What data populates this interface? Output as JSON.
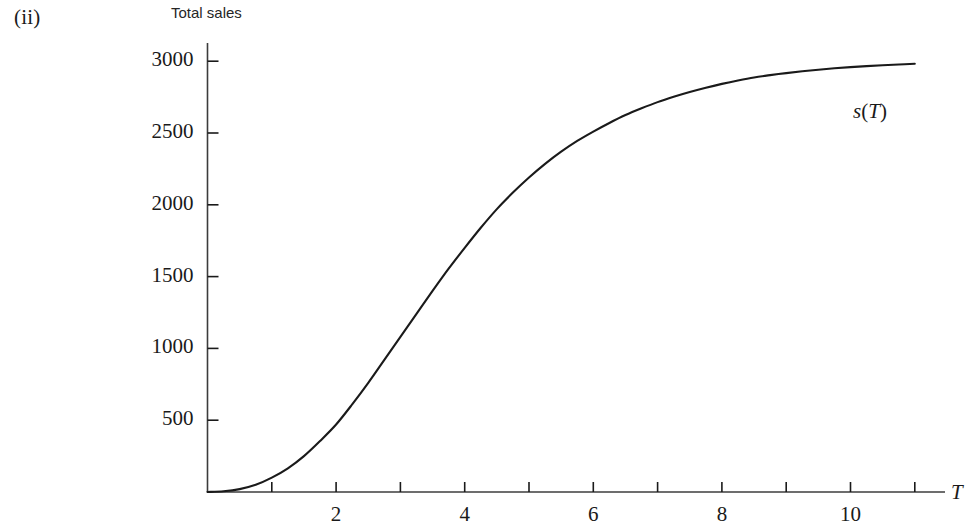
{
  "figure": {
    "part_label": "(ii)",
    "y_axis_title": "Total sales",
    "x_axis_title": "T",
    "curve_label_fn": "s",
    "curve_label_open": "(",
    "curve_label_arg": "T",
    "curve_label_close": ")",
    "line_color": "#1a1a1a",
    "axis_color": "#3c3c3c",
    "background": "#ffffff"
  },
  "chart_data": {
    "type": "line",
    "title": "",
    "subtitle": "",
    "xlabel": "T",
    "ylabel": "Total sales",
    "xlim": [
      0,
      11.5
    ],
    "ylim": [
      0,
      3100
    ],
    "grid": false,
    "legend": null,
    "x_ticks_major": [
      2,
      4,
      6,
      8,
      10
    ],
    "x_ticks_all": [
      1,
      2,
      3,
      4,
      5,
      6,
      7,
      8,
      9,
      10,
      11
    ],
    "x_tick_labels": [
      "2",
      "4",
      "6",
      "8",
      "10"
    ],
    "y_ticks": [
      500,
      1000,
      1500,
      2000,
      2500,
      3000
    ],
    "y_tick_labels": [
      "500",
      "1000",
      "1500",
      "2000",
      "2500",
      "3000"
    ],
    "annotations": [
      {
        "text": "s(T)",
        "x": 10.1,
        "y": 2600
      }
    ],
    "series": [
      {
        "name": "s(T)",
        "color": "#1a1a1a",
        "x": [
          0,
          0.25,
          0.5,
          0.75,
          1,
          1.25,
          1.5,
          1.75,
          2,
          2.25,
          2.5,
          2.75,
          3,
          3.25,
          3.5,
          3.75,
          4,
          4.25,
          4.5,
          4.75,
          5,
          5.25,
          5.5,
          5.75,
          6,
          6.25,
          6.5,
          6.75,
          7,
          7.25,
          7.5,
          7.75,
          8,
          8.25,
          8.5,
          8.75,
          9,
          9.25,
          9.5,
          9.75,
          10,
          10.25,
          10.5,
          10.75,
          11
        ],
        "y": [
          0,
          5,
          20,
          50,
          100,
          165,
          250,
          355,
          470,
          610,
          760,
          920,
          1080,
          1240,
          1400,
          1555,
          1700,
          1840,
          1970,
          2085,
          2190,
          2285,
          2370,
          2445,
          2510,
          2570,
          2625,
          2672,
          2715,
          2752,
          2785,
          2815,
          2842,
          2866,
          2887,
          2903,
          2917,
          2930,
          2941,
          2951,
          2959,
          2966,
          2972,
          2977,
          2982
        ]
      }
    ]
  },
  "geometry": {
    "origin_x": 207.5,
    "origin_y": 492,
    "x_scale_px_per_unit": 64.3,
    "y_scale_px_per_unit": 0.1436,
    "y_axis_top": 43,
    "x_axis_right": 945
  }
}
